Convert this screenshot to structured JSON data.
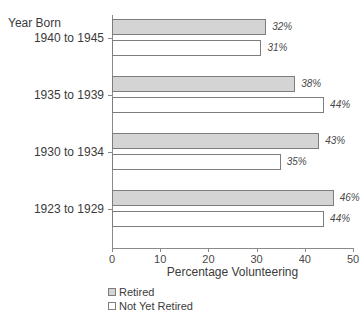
{
  "chart_data": {
    "type": "bar",
    "orientation": "horizontal",
    "title": "",
    "xlabel": "Percentage Volunteering",
    "ylabel": "Year Born",
    "categories": [
      "1940 to 1945",
      "1935 to 1939",
      "1930 to 1934",
      "1923 to 1929"
    ],
    "series": [
      {
        "name": "Retired",
        "values": [
          32,
          38,
          43,
          46
        ],
        "color": "#d4d4d4"
      },
      {
        "name": "Not Yet Retired",
        "values": [
          31,
          44,
          35,
          44
        ],
        "color": "#ffffff"
      }
    ],
    "value_labels": [
      [
        "32%",
        "31%"
      ],
      [
        "38%",
        "44%"
      ],
      [
        "43%",
        "35%"
      ],
      [
        "46%",
        "44%"
      ]
    ],
    "xlim": [
      0,
      50
    ],
    "xticks": [
      0,
      10,
      20,
      30,
      40,
      50
    ],
    "xtick_labels": [
      "0",
      "10",
      "20",
      "30",
      "40",
      "50"
    ],
    "grid": false,
    "legend_position": "bottom-left"
  },
  "axis": {
    "y_title": "Year Born",
    "x_title": "Percentage Volunteering",
    "ticks": [
      {
        "label": "0",
        "value": 0
      },
      {
        "label": "10",
        "value": 10
      },
      {
        "label": "20",
        "value": 20
      },
      {
        "label": "30",
        "value": 30
      },
      {
        "label": "40",
        "value": 40
      },
      {
        "label": "50",
        "value": 50
      }
    ]
  },
  "groups": [
    {
      "category": "1940 to 1945",
      "bars": [
        {
          "series": "Retired",
          "value": 32,
          "label": "32%"
        },
        {
          "series": "Not Yet Retired",
          "value": 31,
          "label": "31%"
        }
      ]
    },
    {
      "category": "1935 to 1939",
      "bars": [
        {
          "series": "Retired",
          "value": 38,
          "label": "38%"
        },
        {
          "series": "Not Yet Retired",
          "value": 44,
          "label": "44%"
        }
      ]
    },
    {
      "category": "1930 to 1934",
      "bars": [
        {
          "series": "Retired",
          "value": 43,
          "label": "43%"
        },
        {
          "series": "Not Yet Retired",
          "value": 35,
          "label": "35%"
        }
      ]
    },
    {
      "category": "1923 to 1929",
      "bars": [
        {
          "series": "Retired",
          "value": 46,
          "label": "46%"
        },
        {
          "series": "Not Yet Retired",
          "value": 44,
          "label": "44%"
        }
      ]
    }
  ],
  "legend": {
    "items": [
      {
        "label": "Retired",
        "swatch": "retired"
      },
      {
        "label": "Not Yet Retired",
        "swatch": "notyet"
      }
    ]
  }
}
